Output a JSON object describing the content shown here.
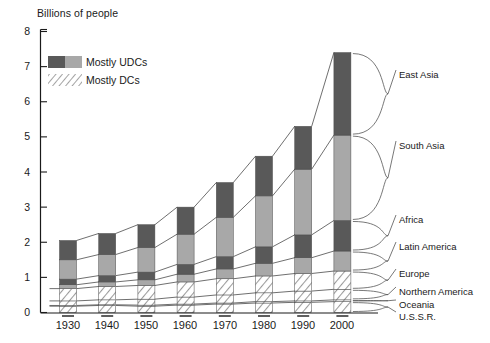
{
  "axes": {
    "y_title": "Billions of people",
    "y_ticks": [
      "8",
      "7",
      "6",
      "5",
      "4",
      "3",
      "2",
      "1",
      "0"
    ],
    "x_ticks": [
      "1930",
      "1940",
      "1950",
      "1960",
      "1970",
      "1980",
      "1990",
      "2000"
    ]
  },
  "legend": {
    "items": [
      {
        "label": "Mostly UDCs",
        "swatch": "solid-two-tone-gray"
      },
      {
        "label": "Mostly DCs",
        "swatch": "hatched-diagonal"
      }
    ]
  },
  "region_labels": [
    "East Asia",
    "South Asia",
    "Africa",
    "Latin America",
    "Europe",
    "Northern America",
    "Oceania",
    "U.S.S.R."
  ],
  "colors": {
    "dark_gray": "#595959",
    "light_gray": "#a8a8a8",
    "hatch_line": "#8c8c8c",
    "axis": "#1a1a1a",
    "background": "#ffffff"
  },
  "chart_data": {
    "type": "bar",
    "title": "",
    "subtitle": "",
    "xlabel": "",
    "ylabel": "Billions of people",
    "ylim": [
      0,
      8
    ],
    "grid": false,
    "legend_position": "top-left",
    "stacked": true,
    "note": "Stacked bar chart of world population by region; bars connected by boundary lines. Series listed bottom-to-top in the stack.",
    "categories": [
      "1930",
      "1940",
      "1950",
      "1960",
      "1970",
      "1980",
      "1990",
      "2000"
    ],
    "series": [
      {
        "name": "U.S.S.R.",
        "fill": "hatched",
        "values": [
          0.18,
          0.2,
          0.18,
          0.21,
          0.24,
          0.27,
          0.29,
          0.31
        ]
      },
      {
        "name": "Oceania",
        "fill": "hatched",
        "values": [
          0.02,
          0.02,
          0.03,
          0.03,
          0.03,
          0.04,
          0.04,
          0.05
        ]
      },
      {
        "name": "Northern America",
        "fill": "hatched",
        "values": [
          0.13,
          0.14,
          0.17,
          0.2,
          0.23,
          0.25,
          0.28,
          0.3
        ]
      },
      {
        "name": "Europe",
        "fill": "hatched",
        "values": [
          0.35,
          0.38,
          0.39,
          0.43,
          0.46,
          0.48,
          0.5,
          0.52
        ]
      },
      {
        "name": "Latin America",
        "fill": "light",
        "values": [
          0.11,
          0.13,
          0.16,
          0.22,
          0.28,
          0.36,
          0.45,
          0.57
        ]
      },
      {
        "name": "Africa",
        "fill": "dark",
        "values": [
          0.16,
          0.18,
          0.22,
          0.28,
          0.35,
          0.47,
          0.65,
          0.87
        ]
      },
      {
        "name": "South Asia",
        "fill": "light",
        "values": [
          0.55,
          0.6,
          0.7,
          0.86,
          1.12,
          1.45,
          1.87,
          2.43
        ]
      },
      {
        "name": "East Asia",
        "fill": "dark",
        "values": [
          0.55,
          0.6,
          0.65,
          0.77,
          0.99,
          1.13,
          1.22,
          2.35
        ]
      }
    ],
    "totals": [
      2.05,
      2.25,
      2.5,
      3.0,
      3.7,
      4.45,
      5.3,
      7.4
    ]
  }
}
